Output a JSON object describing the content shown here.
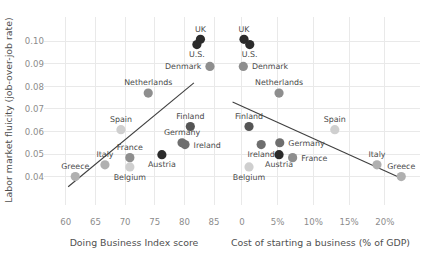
{
  "figure": {
    "background": "#ffffff",
    "dot_colors": {
      "very_dark": "#2b2b2b",
      "dark": "#555555",
      "mid_dark": "#6e6e6e",
      "mid": "#8e8e8e",
      "light": "#b0b0b0",
      "very_light": "#cfcfcf"
    },
    "gridline_color": "#e9e9e9",
    "fitline_color": "#3f3f3f",
    "tick_label_color": "#8c8c8c",
    "axis_label_color": "#4f4f4f",
    "point_label_color": "#4a4a4a"
  },
  "shared": {
    "ylabel": "Labor market fluicity (job-over-job rate)",
    "yticks": [
      "0.04",
      "0.05",
      "0.06",
      "0.07",
      "0.08",
      "0.09",
      "0.10"
    ],
    "ytick_values": [
      0.04,
      0.05,
      0.06,
      0.07,
      0.08,
      0.09,
      0.1
    ],
    "ylim": [
      0.0345,
      0.1045
    ]
  },
  "chart_data": [
    {
      "type": "scatter",
      "panel": "left",
      "title": "",
      "xlabel": "Doing Business Index score",
      "ylabel": "Labor market fluicity (job-over-job rate)",
      "xticks": [
        "60",
        "65",
        "70",
        "75",
        "80",
        "85"
      ],
      "xtick_values": [
        60,
        65,
        70,
        75,
        80,
        85
      ],
      "xlim": [
        57.0,
        86.0
      ],
      "ylim": [
        0.0345,
        0.1045
      ],
      "grid": true,
      "legend": "none",
      "trendline": {
        "x0": 60.4,
        "y0": 0.0355,
        "x1": 81.6,
        "y1": 0.0815,
        "direction": "positive"
      },
      "points": [
        {
          "label": "UK",
          "x": 82.7,
          "y": 0.1008,
          "shade": "very_dark",
          "label_pos": "above"
        },
        {
          "label": "U.S.",
          "x": 82.1,
          "y": 0.0985,
          "shade": "very_dark",
          "label_pos": "below"
        },
        {
          "label": "Denmark",
          "x": 84.3,
          "y": 0.0888,
          "shade": "mid",
          "label_pos": "left"
        },
        {
          "label": "Netherlands",
          "x": 73.9,
          "y": 0.077,
          "shade": "mid",
          "label_pos": "above"
        },
        {
          "label": "Finland",
          "x": 81.0,
          "y": 0.0622,
          "shade": "dark",
          "label_pos": "above"
        },
        {
          "label": "Spain",
          "x": 69.3,
          "y": 0.0608,
          "shade": "very_light",
          "label_pos": "above"
        },
        {
          "label": "Germany",
          "x": 79.6,
          "y": 0.055,
          "shade": "mid_dark",
          "label_pos": "above"
        },
        {
          "label": "Ireland",
          "x": 80.1,
          "y": 0.0542,
          "shade": "mid_dark",
          "label_pos": "right"
        },
        {
          "label": "Austria",
          "x": 76.2,
          "y": 0.0497,
          "shade": "very_dark",
          "label_pos": "below"
        },
        {
          "label": "France",
          "x": 70.8,
          "y": 0.0484,
          "shade": "mid",
          "label_pos": "above"
        },
        {
          "label": "Italy",
          "x": 66.6,
          "y": 0.0452,
          "shade": "light",
          "label_pos": "above"
        },
        {
          "label": "Belgium",
          "x": 70.8,
          "y": 0.0443,
          "shade": "very_light",
          "label_pos": "below"
        },
        {
          "label": "Greece",
          "x": 61.6,
          "y": 0.04,
          "shade": "light",
          "label_pos": "above"
        }
      ]
    },
    {
      "type": "scatter",
      "panel": "right",
      "title": "",
      "xlabel": "Cost of starting a business (% of GDP)",
      "ylabel": "",
      "xticks": [
        "0",
        "5%",
        "10%",
        "15%",
        "20%"
      ],
      "xtick_values": [
        0,
        5,
        10,
        15,
        20
      ],
      "xlim": [
        -1.8,
        23.8
      ],
      "ylim": [
        0.0345,
        0.1045
      ],
      "grid": true,
      "legend": "none",
      "trendline": {
        "x0": -1.3,
        "y0": 0.073,
        "x1": 22.6,
        "y1": 0.0388,
        "direction": "negative"
      },
      "points": [
        {
          "label": "UK",
          "x": 0.3,
          "y": 0.1008,
          "shade": "very_dark",
          "label_pos": "above"
        },
        {
          "label": "U.S.",
          "x": 1.1,
          "y": 0.0985,
          "shade": "very_dark",
          "label_pos": "below"
        },
        {
          "label": "Denmark",
          "x": 0.2,
          "y": 0.0888,
          "shade": "mid",
          "label_pos": "right"
        },
        {
          "label": "Netherlands",
          "x": 5.2,
          "y": 0.077,
          "shade": "mid",
          "label_pos": "above"
        },
        {
          "label": "Finland",
          "x": 1.0,
          "y": 0.0622,
          "shade": "dark",
          "label_pos": "above"
        },
        {
          "label": "Spain",
          "x": 13.0,
          "y": 0.0608,
          "shade": "very_light",
          "label_pos": "above"
        },
        {
          "label": "Germany",
          "x": 5.3,
          "y": 0.055,
          "shade": "mid_dark",
          "label_pos": "right"
        },
        {
          "label": "Ireland",
          "x": 2.7,
          "y": 0.0542,
          "shade": "mid_dark",
          "label_pos": "below"
        },
        {
          "label": "Austria",
          "x": 5.2,
          "y": 0.0497,
          "shade": "very_dark",
          "label_pos": "below"
        },
        {
          "label": "France",
          "x": 7.1,
          "y": 0.0484,
          "shade": "mid",
          "label_pos": "right"
        },
        {
          "label": "Italy",
          "x": 18.9,
          "y": 0.0452,
          "shade": "light",
          "label_pos": "above"
        },
        {
          "label": "Belgium",
          "x": 1.0,
          "y": 0.0443,
          "shade": "very_light",
          "label_pos": "below"
        },
        {
          "label": "Greece",
          "x": 22.3,
          "y": 0.04,
          "shade": "light",
          "label_pos": "above"
        }
      ]
    }
  ]
}
